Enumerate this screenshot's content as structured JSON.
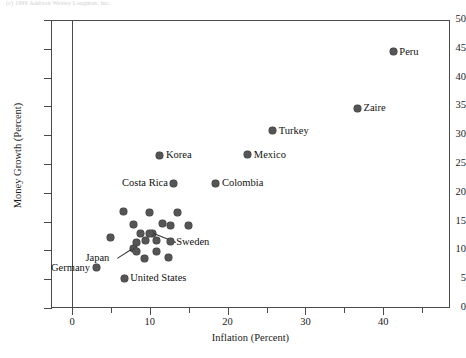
{
  "figure": {
    "top_note": "(c) 1999 Addison Wesley Longman, Inc.",
    "background": "#ffffff",
    "dot_color": "#555555",
    "axis_color": "#4a4a4a"
  },
  "chart_data": {
    "type": "scatter",
    "title": "",
    "xlabel": "Inflation (Percent)",
    "ylabel": "Money Growth (Percent)",
    "xlim": [
      -3,
      48
    ],
    "ylim": [
      0,
      50
    ],
    "grid": false,
    "legend": "none",
    "x_ticks_major": [
      0,
      10,
      20,
      30,
      40
    ],
    "x_ticks_minor": [
      5,
      15,
      25,
      35,
      45
    ],
    "y_ticks": [
      0,
      5,
      10,
      15,
      20,
      25,
      30,
      35,
      40,
      45,
      50
    ],
    "points": [
      {
        "label": "Peru",
        "x": 41.3,
        "y": 44.5,
        "label_pos": "right"
      },
      {
        "label": "Zaire",
        "x": 36.7,
        "y": 34.7,
        "label_pos": "right"
      },
      {
        "label": "Turkey",
        "x": 25.8,
        "y": 30.8,
        "label_pos": "right"
      },
      {
        "label": "Mexico",
        "x": 22.6,
        "y": 26.6,
        "label_pos": "right"
      },
      {
        "label": "Korea",
        "x": 11.3,
        "y": 26.5,
        "label_pos": "right"
      },
      {
        "label": "Colombia",
        "x": 18.5,
        "y": 21.7,
        "label_pos": "right"
      },
      {
        "label": "Costa Rica",
        "x": 13.1,
        "y": 21.7,
        "label_pos": "left"
      },
      {
        "label": "Sweden",
        "x": 10.3,
        "y": 13.0,
        "label_pos": "leader-right"
      },
      {
        "label": "Japan",
        "x": 7.9,
        "y": 10.3,
        "label_pos": "leader-left"
      },
      {
        "label": "Germany",
        "x": 3.1,
        "y": 7.0,
        "label_pos": "left"
      },
      {
        "label": "United States",
        "x": 6.7,
        "y": 5.2,
        "label_pos": "right"
      },
      {
        "label": "",
        "x": 6.6,
        "y": 16.8
      },
      {
        "label": "",
        "x": 10.0,
        "y": 16.5
      },
      {
        "label": "",
        "x": 13.5,
        "y": 16.6
      },
      {
        "label": "",
        "x": 7.9,
        "y": 14.5
      },
      {
        "label": "",
        "x": 11.6,
        "y": 14.6
      },
      {
        "label": "",
        "x": 12.6,
        "y": 14.4
      },
      {
        "label": "",
        "x": 15.0,
        "y": 14.3
      },
      {
        "label": "",
        "x": 4.9,
        "y": 12.2
      },
      {
        "label": "",
        "x": 8.8,
        "y": 13.0
      },
      {
        "label": "",
        "x": 9.9,
        "y": 12.9
      },
      {
        "label": "",
        "x": 9.5,
        "y": 11.7
      },
      {
        "label": "",
        "x": 10.8,
        "y": 11.7
      },
      {
        "label": "",
        "x": 8.3,
        "y": 11.3
      },
      {
        "label": "",
        "x": 12.7,
        "y": 11.6
      },
      {
        "label": "",
        "x": 8.3,
        "y": 9.8
      },
      {
        "label": "",
        "x": 10.8,
        "y": 9.8
      },
      {
        "label": "",
        "x": 9.3,
        "y": 8.6
      },
      {
        "label": "",
        "x": 12.4,
        "y": 8.7
      }
    ]
  }
}
